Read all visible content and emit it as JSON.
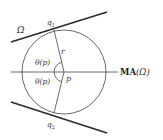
{
  "diagram": {
    "labels": {
      "omega": "Ω",
      "q1": "q",
      "q1_sub": "1",
      "q2": "q",
      "q2_sub": "2",
      "r": "r",
      "theta_upper": "θ(p)",
      "theta_lower": "θ(p)",
      "p": "p",
      "ma_bold": "MA",
      "ma_arg": "(Ω)"
    },
    "colors": {
      "stroke": "#333333",
      "thick_stroke": "#2a2a2a",
      "background": "#ffffff"
    },
    "geometry": {
      "circle_center": [
        64,
        72
      ],
      "circle_radius": 42,
      "axis_y": 72,
      "q1": [
        54,
        30
      ],
      "q2": [
        54,
        113
      ]
    }
  }
}
